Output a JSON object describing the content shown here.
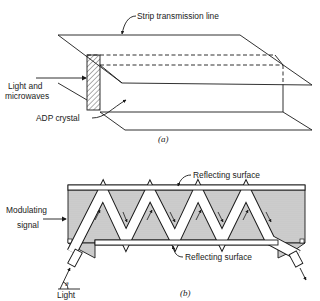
{
  "figure_a": {
    "caption": "(a)",
    "labels": {
      "strip_line": "Strip transmission line",
      "light_line1": "Light and",
      "light_line2": "microwaves",
      "crystal": "ADP crystal"
    }
  },
  "figure_b": {
    "caption": "(b)",
    "labels": {
      "reflecting_top": "Reflecting surface",
      "reflecting_bottom": "Reflecting surface",
      "modulating_line1": "Modulating",
      "modulating_line2": "signal",
      "light": "Light",
      "angle": "θ"
    }
  },
  "colors": {
    "ink": "#1a1a1a",
    "stipple": "#c8c8c8",
    "background": "#ffffff"
  }
}
